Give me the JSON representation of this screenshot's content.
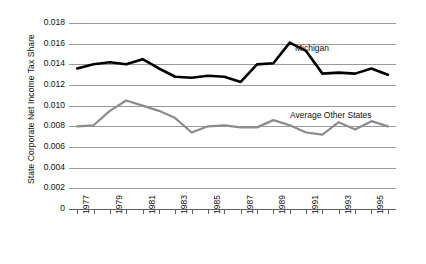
{
  "chart_data": {
    "type": "line",
    "title": "",
    "xlabel": "",
    "ylabel": "State Corporate Net Income Tax Share",
    "x": [
      1977,
      1978,
      1979,
      1980,
      1981,
      1982,
      1983,
      1984,
      1985,
      1986,
      1987,
      1988,
      1989,
      1990,
      1991,
      1992,
      1993,
      1994,
      1995,
      1996
    ],
    "xlim": [
      1976.5,
      1996.5
    ],
    "ylim": [
      0,
      0.018
    ],
    "ytick_labels": [
      "0.018",
      "0.016",
      "0.014",
      "0.012",
      "0.010",
      "0.008",
      "0.006",
      "0.004",
      "0.002",
      "0"
    ],
    "ytick_values": [
      0.018,
      0.016,
      0.014,
      0.012,
      0.01,
      0.008,
      0.006,
      0.004,
      0.002,
      0
    ],
    "xtick_labels": [
      "1977",
      "",
      "1979",
      "",
      "1981",
      "",
      "1983",
      "",
      "1985",
      "",
      "1987",
      "",
      "1989",
      "",
      "1991",
      "",
      "1993",
      "",
      "1995",
      ""
    ],
    "grid": true,
    "legend_position": "inline-annotation",
    "series": [
      {
        "name": "Michigan",
        "color": "#000000",
        "values": [
          0.0136,
          0.014,
          0.0142,
          0.014,
          0.0145,
          0.0136,
          0.0128,
          0.0127,
          0.0129,
          0.0128,
          0.0123,
          0.014,
          0.0141,
          0.0161,
          0.0153,
          0.0131,
          0.0132,
          0.0131,
          0.0136,
          0.013
        ]
      },
      {
        "name": "Average Other States",
        "color": "#8c8c8c",
        "values": [
          0.008,
          0.0081,
          0.0095,
          0.0105,
          0.01,
          0.0095,
          0.0088,
          0.0074,
          0.008,
          0.0081,
          0.0079,
          0.0079,
          0.0086,
          0.0081,
          0.0074,
          0.0072,
          0.0084,
          0.0077,
          0.0085,
          0.008
        ]
      }
    ]
  },
  "annotations": {
    "michigan_label": "Michigan",
    "other_states_label": "Average Other States"
  }
}
